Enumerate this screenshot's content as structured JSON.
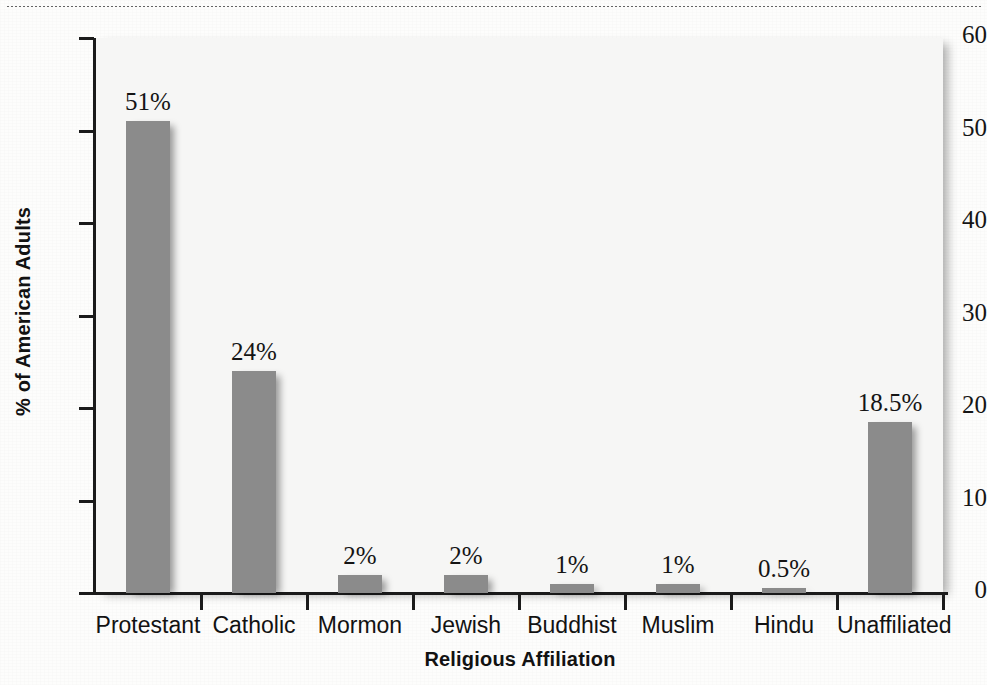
{
  "page": {
    "top_rule": "dotted-rule",
    "bleed_through": [
      "Managing Age Discrimination",
      "faint reverse-side text",
      "faint reverse-side text",
      "faint reverse-side text"
    ]
  },
  "chart_data": {
    "type": "bar",
    "title": "",
    "xlabel": "Religious Affiliation",
    "ylabel": "% of American Adults",
    "ylim": [
      0,
      60
    ],
    "yticks": [
      0,
      10,
      20,
      30,
      40,
      50,
      60
    ],
    "ytick_labels": [
      "0",
      "10",
      "20",
      "30",
      "40",
      "50",
      "60"
    ],
    "grid": false,
    "legend": false,
    "bar_color": "#8b8b8b",
    "plot_background": "#f6f6f5",
    "categories": [
      "Protestant",
      "Catholic",
      "Mormon",
      "Jewish",
      "Buddhist",
      "Muslim",
      "Hindu",
      "Unaffiliated"
    ],
    "values": [
      51,
      24,
      2,
      2,
      1,
      1,
      0.5,
      18.5
    ],
    "value_labels": [
      "51%",
      "24%",
      "2%",
      "2%",
      "1%",
      "1%",
      "0.5%",
      "18.5%"
    ]
  }
}
